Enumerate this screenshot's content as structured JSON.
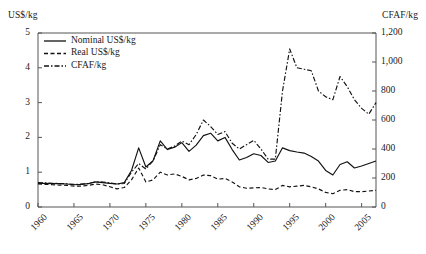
{
  "chart_data": {
    "type": "line",
    "title": "",
    "xlabel": "",
    "ylabel": "US$/kg",
    "ylabel_right": "CFAF/kg",
    "grid": false,
    "legend_position": "top-left",
    "xlim": [
      1960,
      2007
    ],
    "ylim": [
      0,
      5
    ],
    "ylim_right": [
      0,
      1200
    ],
    "xticks": [
      "1960",
      "1965",
      "1970",
      "1975",
      "1980",
      "1985",
      "1990",
      "1995",
      "2000",
      "2005"
    ],
    "yticks_left": [
      "0",
      "1",
      "2",
      "3",
      "4",
      "5"
    ],
    "yticks_right": [
      "0",
      "200",
      "400",
      "600",
      "800",
      "1,000",
      "1,200"
    ],
    "x": [
      1960,
      1961,
      1962,
      1963,
      1964,
      1965,
      1966,
      1967,
      1968,
      1969,
      1970,
      1971,
      1972,
      1973,
      1974,
      1975,
      1976,
      1977,
      1978,
      1979,
      1980,
      1981,
      1982,
      1983,
      1984,
      1985,
      1986,
      1987,
      1988,
      1989,
      1990,
      1991,
      1992,
      1993,
      1994,
      1995,
      1996,
      1997,
      1998,
      1999,
      2000,
      2001,
      2002,
      2003,
      2004,
      2005,
      2006,
      2007
    ],
    "series": [
      {
        "name": "Nominal US$/kg",
        "style": "solid",
        "axis": "left",
        "unit": "US$/kg",
        "values": [
          0.68,
          0.68,
          0.67,
          0.67,
          0.66,
          0.64,
          0.65,
          0.67,
          0.72,
          0.7,
          0.68,
          0.66,
          0.7,
          1.05,
          1.7,
          1.15,
          1.33,
          1.9,
          1.65,
          1.72,
          1.85,
          1.6,
          1.78,
          2.05,
          2.12,
          1.9,
          2.0,
          1.65,
          1.35,
          1.42,
          1.53,
          1.48,
          1.28,
          1.32,
          1.7,
          1.62,
          1.58,
          1.55,
          1.45,
          1.32,
          1.05,
          0.92,
          1.22,
          1.3,
          1.12,
          1.18,
          1.25,
          1.32
        ]
      },
      {
        "name": "Real US$/kg",
        "style": "dashed",
        "axis": "left",
        "unit": "US$/kg (2000 constant)",
        "values": [
          0.66,
          0.65,
          0.64,
          0.63,
          0.62,
          0.6,
          0.6,
          0.62,
          0.66,
          0.64,
          0.58,
          0.52,
          0.56,
          0.78,
          1.12,
          0.72,
          0.78,
          1.0,
          0.92,
          0.95,
          0.88,
          0.78,
          0.82,
          0.92,
          0.9,
          0.8,
          0.82,
          0.72,
          0.58,
          0.54,
          0.55,
          0.56,
          0.52,
          0.5,
          0.62,
          0.58,
          0.6,
          0.62,
          0.58,
          0.52,
          0.42,
          0.38,
          0.48,
          0.5,
          0.44,
          0.44,
          0.46,
          0.48
        ]
      },
      {
        "name": "CFAF/kg",
        "style": "dashdot",
        "axis": "right",
        "unit": "CFAF/kg",
        "values": [
          168,
          166,
          164,
          162,
          160,
          156,
          158,
          162,
          175,
          172,
          166,
          158,
          162,
          240,
          300,
          262,
          318,
          430,
          400,
          420,
          455,
          430,
          500,
          600,
          555,
          500,
          520,
          440,
          400,
          430,
          460,
          400,
          330,
          330,
          800,
          1090,
          960,
          950,
          940,
          800,
          760,
          740,
          900,
          830,
          740,
          680,
          640,
          720
        ]
      }
    ]
  },
  "legend": {
    "items": [
      {
        "label": "Nominal US$/kg",
        "style": "solid"
      },
      {
        "label": "Real US$/kg",
        "style": "dashed"
      },
      {
        "label": "CFAF/kg",
        "style": "dashdot"
      }
    ]
  },
  "colors": {
    "line": "#111111",
    "axis": "#555555",
    "background": "#ffffff"
  }
}
